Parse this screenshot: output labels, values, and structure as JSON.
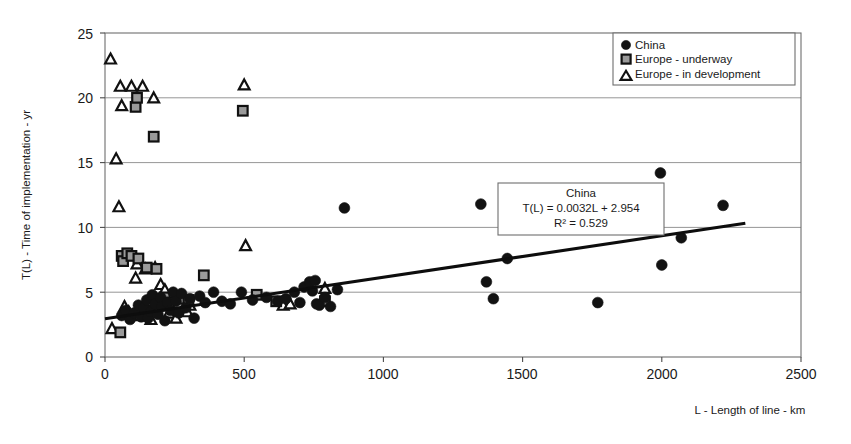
{
  "chart_data": {
    "type": "scatter",
    "title": "",
    "xlabel": "L - Length of line - km",
    "ylabel": "T(L) - Time of implementation - yr",
    "xlim": [
      0,
      2500
    ],
    "ylim": [
      0,
      25
    ],
    "xticks": [
      "0",
      "500",
      "1000",
      "1500",
      "2000",
      "2500"
    ],
    "xtick_values": [
      0,
      500,
      1000,
      1500,
      2000,
      2500
    ],
    "yticks": [
      "0",
      "5",
      "10",
      "15",
      "20",
      "25"
    ],
    "ytick_values": [
      0,
      5,
      10,
      15,
      20,
      25
    ],
    "grid": "horizontal",
    "legend_position": "top-right",
    "legend": [
      {
        "label": "China",
        "marker": "circle"
      },
      {
        "label": "Europe - underway",
        "marker": "square"
      },
      {
        "label": "Europe - in development",
        "marker": "triangle"
      }
    ],
    "annotations": {
      "equation_box": {
        "title": "China",
        "equation": "T(L)  = 0.0032L + 2.954",
        "r2": "R² = 0.529"
      }
    },
    "trendline": {
      "series": "China",
      "slope": 0.0032,
      "intercept": 2.954,
      "r2": 0.529,
      "x_start": 0,
      "x_end": 2300
    },
    "series": [
      {
        "name": "China",
        "marker": "circle",
        "points": [
          [
            60,
            3.2
          ],
          [
            75,
            3.6
          ],
          [
            90,
            2.9
          ],
          [
            105,
            3.4
          ],
          [
            120,
            4.0
          ],
          [
            130,
            3.1
          ],
          [
            140,
            3.8
          ],
          [
            150,
            4.4
          ],
          [
            155,
            3.0
          ],
          [
            165,
            3.5
          ],
          [
            170,
            4.8
          ],
          [
            180,
            4.1
          ],
          [
            190,
            3.3
          ],
          [
            200,
            4.6
          ],
          [
            205,
            3.9
          ],
          [
            215,
            2.8
          ],
          [
            225,
            4.2
          ],
          [
            235,
            3.6
          ],
          [
            245,
            5.0
          ],
          [
            255,
            4.3
          ],
          [
            265,
            3.4
          ],
          [
            275,
            4.9
          ],
          [
            290,
            3.8
          ],
          [
            305,
            4.5
          ],
          [
            320,
            3.0
          ],
          [
            340,
            4.7
          ],
          [
            360,
            4.2
          ],
          [
            390,
            5.0
          ],
          [
            420,
            4.3
          ],
          [
            450,
            4.1
          ],
          [
            490,
            5.0
          ],
          [
            530,
            4.4
          ],
          [
            580,
            4.6
          ],
          [
            620,
            4.3
          ],
          [
            650,
            4.5
          ],
          [
            680,
            5.0
          ],
          [
            700,
            4.2
          ],
          [
            715,
            5.4
          ],
          [
            735,
            5.8
          ],
          [
            745,
            5.1
          ],
          [
            755,
            5.9
          ],
          [
            760,
            4.1
          ],
          [
            770,
            4.0
          ],
          [
            790,
            4.6
          ],
          [
            810,
            3.9
          ],
          [
            835,
            5.2
          ],
          [
            860,
            11.5
          ],
          [
            1350,
            11.8
          ],
          [
            1370,
            5.8
          ],
          [
            1395,
            4.5
          ],
          [
            1445,
            7.6
          ],
          [
            1770,
            4.2
          ],
          [
            1995,
            14.2
          ],
          [
            2000,
            7.1
          ],
          [
            2070,
            9.2
          ],
          [
            2220,
            11.7
          ]
        ]
      },
      {
        "name": "Europe - underway",
        "marker": "square",
        "points": [
          [
            55,
            1.9
          ],
          [
            60,
            7.8
          ],
          [
            65,
            7.4
          ],
          [
            80,
            8.0
          ],
          [
            95,
            7.8
          ],
          [
            110,
            19.3
          ],
          [
            115,
            20.0
          ],
          [
            120,
            7.6
          ],
          [
            150,
            6.9
          ],
          [
            175,
            17.0
          ],
          [
            185,
            6.8
          ],
          [
            215,
            4.6
          ],
          [
            230,
            4.2
          ],
          [
            270,
            4.5
          ],
          [
            300,
            4.4
          ],
          [
            355,
            6.3
          ],
          [
            495,
            19.0
          ],
          [
            545,
            4.8
          ],
          [
            615,
            4.3
          ],
          [
            790,
            4.3
          ]
        ]
      },
      {
        "name": "Europe - in development",
        "marker": "triangle",
        "points": [
          [
            20,
            23.0
          ],
          [
            25,
            2.2
          ],
          [
            40,
            15.3
          ],
          [
            50,
            11.6
          ],
          [
            55,
            20.9
          ],
          [
            60,
            19.4
          ],
          [
            70,
            3.9
          ],
          [
            85,
            3.5
          ],
          [
            95,
            20.9
          ],
          [
            110,
            6.1
          ],
          [
            115,
            7.2
          ],
          [
            125,
            3.2
          ],
          [
            135,
            20.9
          ],
          [
            145,
            6.8
          ],
          [
            150,
            3.7
          ],
          [
            160,
            4.3
          ],
          [
            165,
            2.9
          ],
          [
            175,
            20.0
          ],
          [
            180,
            6.9
          ],
          [
            200,
            5.6
          ],
          [
            215,
            5.2
          ],
          [
            230,
            3.4
          ],
          [
            255,
            3.0
          ],
          [
            295,
            3.5
          ],
          [
            305,
            4.0
          ],
          [
            500,
            21.0
          ],
          [
            505,
            8.6
          ],
          [
            640,
            4.0
          ],
          [
            665,
            4.1
          ],
          [
            790,
            5.3
          ]
        ]
      }
    ]
  },
  "axis": {
    "x_title": "L - Length of line - km",
    "y_title": "T(L) - Time of implementation - yr"
  },
  "legend": {
    "item_0": "China",
    "item_1": "Europe - underway",
    "item_2": "Europe - in development"
  },
  "equation": {
    "line_0": "China",
    "line_1": "T(L)  = 0.0032L + 2.954",
    "line_2": "R² = 0.529"
  },
  "xticks": {
    "t0": "0",
    "t1": "500",
    "t2": "1000",
    "t3": "1500",
    "t4": "2000",
    "t5": "2500"
  },
  "yticks": {
    "t0": "0",
    "t1": "5",
    "t2": "10",
    "t3": "15",
    "t4": "20",
    "t5": "25"
  }
}
